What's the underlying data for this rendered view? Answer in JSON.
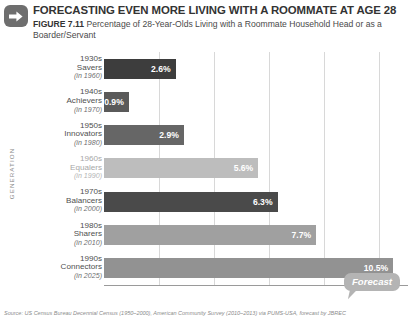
{
  "header": {
    "arrow_icon": "arrow-right-icon",
    "title": "FORECASTING EVEN MORE LIVING WITH A ROOMMATE AT AGE 28",
    "figure_label": "FIGURE 7.11",
    "subtitle": "Percentage of 28-Year-Olds Living with a Roommate Household Head or as a Boarder/Servant"
  },
  "callout": {
    "label": "Forecast"
  },
  "source": {
    "text": "Source: US Census Bureau Decennial Census (1950–2000), American Community Survey (2010–2013) via PUMS-USA, forecast by JBREC"
  },
  "chart_data": {
    "type": "bar",
    "orientation": "horizontal",
    "title": "FORECASTING EVEN MORE LIVING WITH A ROOMMATE AT AGE 28",
    "subtitle": "Percentage of 28-Year-Olds Living with a Roommate Household Head or as a Boarder/Servant",
    "xlabel": "PERCENT OF 28-YEAR-OLDS",
    "ylabel": "GENERATION",
    "xlim": [
      0,
      11
    ],
    "xticks": [
      "0%",
      "2%",
      "4%",
      "6%",
      "8%",
      "10%"
    ],
    "xtick_values": [
      0,
      2,
      4,
      6,
      8,
      10
    ],
    "grid": true,
    "legend": "none",
    "categories": [
      {
        "decade": "1930s",
        "name": "Savers",
        "year": "(in 1960)"
      },
      {
        "decade": "1940s",
        "name": "Achievers",
        "year": "(in 1970)"
      },
      {
        "decade": "1950s",
        "name": "Innovators",
        "year": "(in 1980)"
      },
      {
        "decade": "1960s",
        "name": "Equalers",
        "year": "(in 1990)"
      },
      {
        "decade": "1970s",
        "name": "Balancers",
        "year": "(in 2000)"
      },
      {
        "decade": "1980s",
        "name": "Sharers",
        "year": "(in 2010)"
      },
      {
        "decade": "1990s",
        "name": "Connectors",
        "year": "(in 2025)"
      }
    ],
    "values": [
      2.6,
      0.9,
      2.9,
      5.6,
      6.3,
      7.7,
      10.5
    ],
    "labels": [
      "2.6%",
      "0.9%",
      "2.9%",
      "5.6%",
      "6.3%",
      "7.7%",
      "10.5%"
    ],
    "bar_colors": [
      "#3d3d3d",
      "#5a5a5a",
      "#666666",
      "#bdbdbd",
      "#4a4a4a",
      "#a0a0a0",
      "#929292"
    ],
    "annotations": [
      {
        "text": "Forecast",
        "target_category": "1990s Connectors"
      }
    ]
  }
}
